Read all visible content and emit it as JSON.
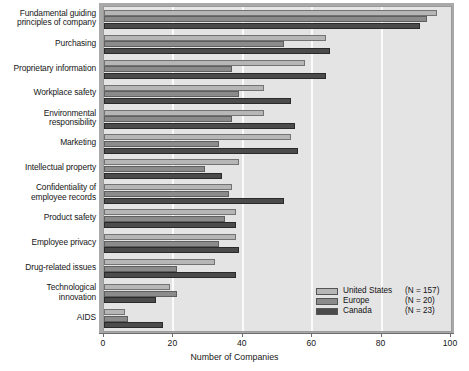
{
  "chart_data": {
    "type": "bar",
    "orientation": "horizontal",
    "title": "",
    "xlabel": "Number of Companies",
    "ylabel": "",
    "xlim": [
      0,
      100
    ],
    "xticks": [
      0,
      20,
      40,
      60,
      80,
      100
    ],
    "grid": "vertical",
    "legend_position": "bottom-right",
    "categories": [
      "Fundamental guiding\nprinciples of company",
      "Purchasing",
      "Proprietary information",
      "Workplace safety",
      "Environmental\nresponsibility",
      "Marketing",
      "Intellectual property",
      "Confidentiality of\nemployee records",
      "Product safety",
      "Employee privacy",
      "Drug-related issues",
      "Technological\ninnovation",
      "AIDS"
    ],
    "series": [
      {
        "name": "United States",
        "n_label": "(N = 157)",
        "color": "#b6b6b6",
        "values": [
          96,
          64,
          58,
          46,
          46,
          54,
          39,
          37,
          38,
          38,
          32,
          19,
          6
        ]
      },
      {
        "name": "Europe",
        "n_label": "(N = 20)",
        "color": "#8b8b8b",
        "values": [
          93,
          52,
          37,
          39,
          37,
          33,
          29,
          36,
          35,
          33,
          21,
          21,
          7
        ]
      },
      {
        "name": "Canada",
        "n_label": "(N = 23)",
        "color": "#4b4b4b",
        "values": [
          91,
          65,
          64,
          54,
          55,
          56,
          34,
          52,
          38,
          39,
          38,
          15,
          17
        ]
      }
    ]
  },
  "legend": {
    "rows": [
      {
        "name": "United States",
        "n": "(N = 157)"
      },
      {
        "name": "Europe",
        "n": "(N = 20)"
      },
      {
        "name": "Canada",
        "n": "(N = 23)"
      }
    ]
  },
  "axis": {
    "x_title": "Number of Companies",
    "x_tick_labels": [
      "0",
      "20",
      "40",
      "60",
      "80",
      "100"
    ]
  }
}
